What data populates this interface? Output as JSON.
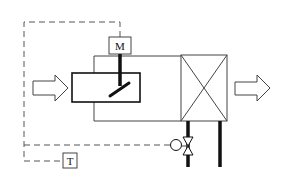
{
  "diagram": {
    "labels": {
      "motor": "M",
      "temperature_sensor": "T"
    },
    "components": [
      "inlet-air-arrow",
      "damper",
      "damper-motor",
      "heat-exchanger",
      "outlet-air-arrow",
      "control-valve",
      "valve-actuator",
      "temperature-sensor",
      "supply-pipe",
      "return-pipe",
      "control-signal-lines"
    ],
    "colors": {
      "line": "#111111",
      "thin_line": "#444444",
      "dashed_line": "#555555",
      "background": "#ffffff"
    }
  }
}
